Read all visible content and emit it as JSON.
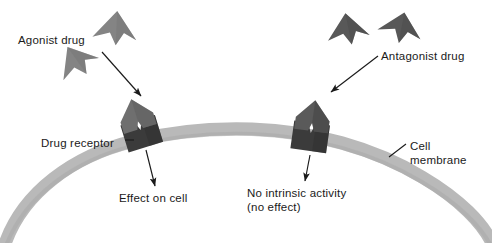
{
  "diagram": {
    "background_color": "#ffffff",
    "width": 492,
    "height": 243
  },
  "colors": {
    "membrane": "#b9b9b9",
    "membrane_shade": "#a9a9a9",
    "receptor_base": "#3b3b3b",
    "receptor_base_dark": "#2e2e2e",
    "agonist_fill": "#848484",
    "agonist_shade": "#767676",
    "antagonist_fill": "#585858",
    "antagonist_shade": "#4c4c4c",
    "bound_ligand": "#6f6f6f",
    "arrow": "#1a1a1a",
    "text": "#1a1a1a"
  },
  "labels": {
    "agonist_drug": "Agonist drug",
    "antagonist_drug": "Antagonist drug",
    "drug_receptor": "Drug receptor",
    "cell_membrane_line1": "Cell",
    "cell_membrane_line2": "membrane",
    "effect_on_cell": "Effect on cell",
    "no_intrinsic_line1": "No intrinsic activity",
    "no_intrinsic_line2": "(no effect)"
  },
  "elements": {
    "membrane": {
      "name": "cell-membrane-arc",
      "description": "thick light gray arc representing the cell membrane"
    },
    "receptor_left": {
      "name": "drug-receptor-left",
      "description": "dark receptor base with V-shaped binding cleft, agonist bound",
      "state": "occupied-by-agonist"
    },
    "receptor_right": {
      "name": "drug-receptor-right",
      "description": "dark receptor base with V-shaped binding cleft, antagonist bound",
      "state": "occupied-by-antagonist"
    },
    "agonist_molecules": [
      {
        "name": "agonist-molecule-1"
      },
      {
        "name": "agonist-molecule-2"
      }
    ],
    "antagonist_molecules": [
      {
        "name": "antagonist-molecule-1"
      },
      {
        "name": "antagonist-molecule-2"
      }
    ],
    "arrows": [
      {
        "name": "arrow-agonist-to-receptor",
        "from": "agonist-drug-label",
        "to": "drug-receptor-left"
      },
      {
        "name": "arrow-antagonist-to-receptor",
        "from": "antagonist-drug-label",
        "to": "drug-receptor-right"
      },
      {
        "name": "arrow-effect-on-cell",
        "from": "drug-receptor-left",
        "to": "effect-on-cell-label"
      },
      {
        "name": "arrow-no-intrinsic-activity",
        "from": "drug-receptor-right",
        "to": "no-intrinsic-activity-label"
      },
      {
        "name": "leader-drug-receptor",
        "from": "drug-receptor-label",
        "to": "drug-receptor-left"
      },
      {
        "name": "leader-cell-membrane",
        "from": "cell-membrane-label",
        "to": "cell-membrane-arc"
      }
    ]
  }
}
